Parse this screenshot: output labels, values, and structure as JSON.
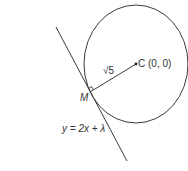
{
  "diagram": {
    "type": "geometry",
    "circle": {
      "center_label": "C (0, 0)",
      "center_name": "C",
      "center_coords": "(0, 0)"
    },
    "radius": {
      "label": "√5"
    },
    "tangent_point": {
      "label": "M"
    },
    "tangent_line": {
      "equation": "y = 2x + λ"
    },
    "right_angle_marker": true,
    "colors": {
      "stroke": "#3a3a3a",
      "text": "#333333",
      "background": "#ffffff"
    }
  }
}
